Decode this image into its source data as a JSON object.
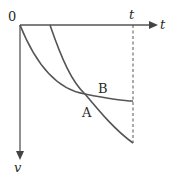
{
  "diagram": {
    "type": "velocity-time graph",
    "origin_label": "0",
    "x_axis": {
      "label": "t",
      "direction": "right"
    },
    "y_axis": {
      "label": "v",
      "direction": "down"
    },
    "time_marker": {
      "label": "t",
      "style": "dashed vertical line"
    },
    "curves": [
      {
        "name": "B",
        "label": "B",
        "description": "starts at origin, decreasing curvature, levels off"
      },
      {
        "name": "A",
        "label": "A",
        "description": "starts later on t-axis, steeper, crosses B"
      }
    ],
    "intersection": "curves A and B cross",
    "colors": {
      "line": "#555555",
      "text": "#2a2a2a",
      "background": "#ffffff"
    }
  }
}
